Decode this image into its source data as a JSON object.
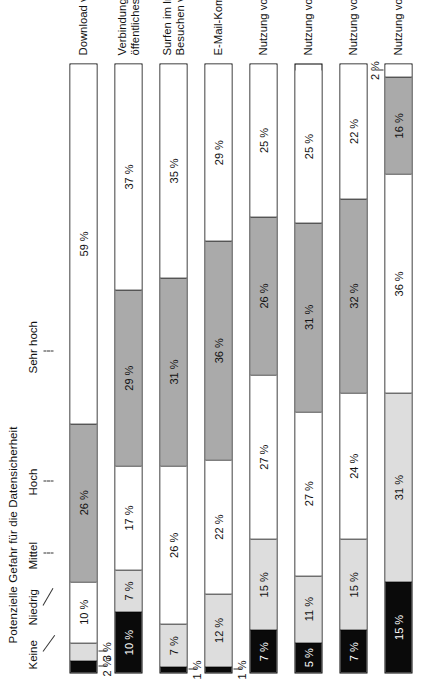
{
  "chart_data": {
    "type": "bar",
    "subtype": "stacked-horizontal-100pct",
    "title": "Potenzielle Gefahr für die Datensicherheit",
    "xlabel": "",
    "ylabel": "",
    "xlim": [
      0,
      100
    ],
    "grid": false,
    "legend_position": "top",
    "orientation": "page-rotated-90-ccw",
    "unit": "%",
    "legend": [
      "Keine",
      "Niedrig",
      "Mittel",
      "Hoch",
      "Sehr hoch"
    ],
    "categories": [
      "Download von Programmen/Daten",
      "Verbindung mit dem Internet über ein öffentliches drahtloses Netzwerk",
      "Surfen im Internet, Besuchen von Websites",
      "E-Mail-Kommunikation",
      "Nutzung von online Chats",
      "Nutzung von sozialen Netzwerken",
      "Nutzung von Messenger Programmen",
      "Nutzung von Videokonferenzen"
    ],
    "series": [
      {
        "name": "Keine",
        "values": [
          2,
          10,
          1,
          1,
          7,
          5,
          7,
          15
        ]
      },
      {
        "name": "Niedrig",
        "values": [
          3,
          7,
          7,
          12,
          15,
          11,
          15,
          31
        ]
      },
      {
        "name": "Mittel",
        "values": [
          10,
          17,
          26,
          22,
          27,
          27,
          24,
          36
        ]
      },
      {
        "name": "Hoch",
        "values": [
          26,
          29,
          31,
          36,
          26,
          31,
          32,
          16
        ]
      },
      {
        "name": "Sehr hoch",
        "values": [
          59,
          37,
          35,
          29,
          25,
          25,
          22,
          2
        ]
      }
    ]
  },
  "legend": {
    "title": "Potenzielle Gefahr für die Datensicherheit",
    "items": [
      {
        "key": "keine",
        "label": "Keine"
      },
      {
        "key": "niedrig",
        "label": "Niedrig"
      },
      {
        "key": "mittel",
        "label": "Mittel"
      },
      {
        "key": "hoch",
        "label": "Hoch"
      },
      {
        "key": "sehr",
        "label": "Sehr hoch"
      }
    ]
  },
  "rows": [
    {
      "category_line1": "Download von Programmen/Daten",
      "category_line2": "",
      "segments": [
        {
          "label": "2 %",
          "value": 2,
          "class": "seg-keine",
          "placement": "outside"
        },
        {
          "label": "3 %",
          "value": 3,
          "class": "seg-niedrig",
          "placement": "outside"
        },
        {
          "label": "10 %",
          "value": 10,
          "class": "seg-mittel",
          "placement": "inside"
        },
        {
          "label": "26 %",
          "value": 26,
          "class": "seg-hoch",
          "placement": "inside"
        },
        {
          "label": "59 %",
          "value": 59,
          "class": "seg-sehr",
          "placement": "inside"
        }
      ]
    },
    {
      "category_line1": "Verbindung mit dem Internet über ein",
      "category_line2": "öffentliches drahtloses Netzwerk",
      "segments": [
        {
          "label": "10 %",
          "value": 10,
          "class": "seg-keine",
          "placement": "inside"
        },
        {
          "label": "7 %",
          "value": 7,
          "class": "seg-niedrig",
          "placement": "inside"
        },
        {
          "label": "17 %",
          "value": 17,
          "class": "seg-mittel",
          "placement": "inside"
        },
        {
          "label": "29 %",
          "value": 29,
          "class": "seg-hoch",
          "placement": "inside"
        },
        {
          "label": "37 %",
          "value": 37,
          "class": "seg-sehr",
          "placement": "inside"
        }
      ]
    },
    {
      "category_line1": "Surfen im Internet,",
      "category_line2": "Besuchen von Websites",
      "segments": [
        {
          "label": "1 %",
          "value": 1,
          "class": "seg-keine",
          "placement": "outside"
        },
        {
          "label": "7 %",
          "value": 7,
          "class": "seg-niedrig",
          "placement": "inside"
        },
        {
          "label": "26 %",
          "value": 26,
          "class": "seg-mittel",
          "placement": "inside"
        },
        {
          "label": "31 %",
          "value": 31,
          "class": "seg-hoch",
          "placement": "inside"
        },
        {
          "label": "35 %",
          "value": 35,
          "class": "seg-sehr",
          "placement": "inside"
        }
      ]
    },
    {
      "category_line1": "E-Mail-Kommunikation",
      "category_line2": "",
      "segments": [
        {
          "label": "1 %",
          "value": 1,
          "class": "seg-keine",
          "placement": "outside"
        },
        {
          "label": "12 %",
          "value": 12,
          "class": "seg-niedrig",
          "placement": "inside"
        },
        {
          "label": "22 %",
          "value": 22,
          "class": "seg-mittel",
          "placement": "inside"
        },
        {
          "label": "36 %",
          "value": 36,
          "class": "seg-hoch",
          "placement": "inside"
        },
        {
          "label": "29 %",
          "value": 29,
          "class": "seg-sehr",
          "placement": "inside"
        }
      ]
    },
    {
      "category_line1": "Nutzung von online Chats",
      "category_line2": "",
      "segments": [
        {
          "label": "7 %",
          "value": 7,
          "class": "seg-keine",
          "placement": "inside"
        },
        {
          "label": "15 %",
          "value": 15,
          "class": "seg-niedrig",
          "placement": "inside"
        },
        {
          "label": "27 %",
          "value": 27,
          "class": "seg-mittel",
          "placement": "inside"
        },
        {
          "label": "26 %",
          "value": 26,
          "class": "seg-hoch",
          "placement": "inside"
        },
        {
          "label": "25 %",
          "value": 25,
          "class": "seg-sehr",
          "placement": "inside"
        }
      ]
    },
    {
      "category_line1": "Nutzung von sozialen Netzwerken",
      "category_line2": "",
      "segments": [
        {
          "label": "5 %",
          "value": 5,
          "class": "seg-keine",
          "placement": "inside"
        },
        {
          "label": "11 %",
          "value": 11,
          "class": "seg-niedrig",
          "placement": "inside"
        },
        {
          "label": "27 %",
          "value": 27,
          "class": "seg-mittel",
          "placement": "inside"
        },
        {
          "label": "31 %",
          "value": 31,
          "class": "seg-hoch",
          "placement": "inside"
        },
        {
          "label": "25 %",
          "value": 25,
          "class": "seg-sehr",
          "placement": "inside"
        }
      ]
    },
    {
      "category_line1": "Nutzung von Messenger Programmen",
      "category_line2": "",
      "segments": [
        {
          "label": "7 %",
          "value": 7,
          "class": "seg-keine",
          "placement": "inside"
        },
        {
          "label": "15 %",
          "value": 15,
          "class": "seg-niedrig",
          "placement": "inside"
        },
        {
          "label": "24 %",
          "value": 24,
          "class": "seg-mittel",
          "placement": "inside"
        },
        {
          "label": "32 %",
          "value": 32,
          "class": "seg-hoch",
          "placement": "inside"
        },
        {
          "label": "22 %",
          "value": 22,
          "class": "seg-sehr",
          "placement": "inside"
        }
      ]
    },
    {
      "category_line1": "Nutzung von Videokonferenzen",
      "category_line2": "",
      "segments": [
        {
          "label": "15 %",
          "value": 15,
          "class": "seg-keine",
          "placement": "inside"
        },
        {
          "label": "31 %",
          "value": 31,
          "class": "seg-niedrig",
          "placement": "inside"
        },
        {
          "label": "36 %",
          "value": 36,
          "class": "seg-mittel",
          "placement": "inside"
        },
        {
          "label": "16 %",
          "value": 16,
          "class": "seg-hoch",
          "placement": "inside"
        },
        {
          "label": "2 %",
          "value": 2,
          "class": "seg-sehr",
          "placement": "outside-hi"
        }
      ]
    }
  ]
}
